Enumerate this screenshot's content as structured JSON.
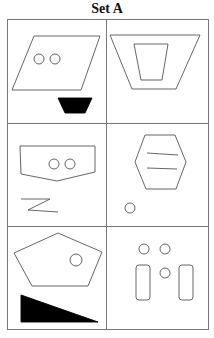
{
  "title": "Set A",
  "colors": {
    "line": "#555555",
    "fill": "#000000",
    "grid": "#777777"
  },
  "grid": {
    "rows": 3,
    "cols": 2
  },
  "cells": [
    {
      "id": "r1c1",
      "shapes": [
        "parallelogram-with-two-circles",
        "filled-trapezoid"
      ]
    },
    {
      "id": "r1c2",
      "shapes": [
        "trapezoid-with-inner-trapezoid"
      ]
    },
    {
      "id": "r2c1",
      "shapes": [
        "pentagon-banner-with-two-circles",
        "zigzag-z"
      ]
    },
    {
      "id": "r2c2",
      "shapes": [
        "hexagon-with-two-lines",
        "small-circle"
      ]
    },
    {
      "id": "r3c1",
      "shapes": [
        "pentagon-with-circle",
        "filled-right-triangle"
      ]
    },
    {
      "id": "r3c2",
      "shapes": [
        "three-circles",
        "two-rounded-rectangles"
      ]
    }
  ]
}
